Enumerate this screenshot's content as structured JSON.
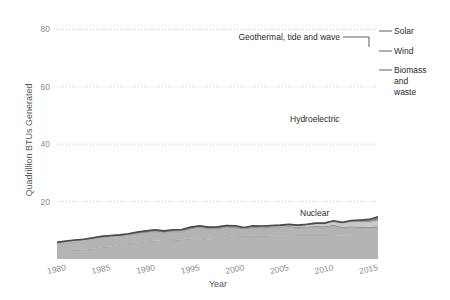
{
  "chart_data": {
    "type": "area",
    "title": "",
    "subtitle": "",
    "xlabel": "Year",
    "ylabel": "Quadrillion BTUs Generated",
    "xlim": [
      1980,
      2016
    ],
    "ylim": [
      0,
      84
    ],
    "xticks": [
      1980,
      1985,
      1990,
      1995,
      2000,
      2005,
      2010,
      2015
    ],
    "xtick_labels": [
      "1980",
      "1985",
      "1990",
      "1995",
      "2000",
      "2005",
      "2010",
      "2015"
    ],
    "yticks": [
      20,
      40,
      60,
      80
    ],
    "ytick_labels": [
      "20",
      "40",
      "60",
      "80"
    ],
    "grid": "horizontal dotted",
    "legend_position": "inline annotations (in-plot labels and right-edge labels)",
    "stacked": true,
    "x": [
      1980,
      1981,
      1982,
      1983,
      1984,
      1985,
      1986,
      1987,
      1988,
      1989,
      1990,
      1991,
      1992,
      1993,
      1994,
      1995,
      1996,
      1997,
      1998,
      1999,
      2000,
      2001,
      2002,
      2003,
      2004,
      2005,
      2006,
      2007,
      2008,
      2009,
      2010,
      2011,
      2012,
      2013,
      2014,
      2015,
      2016
    ],
    "series": [
      {
        "name": "Nuclear",
        "label_in_plot": "Nuclear",
        "color": "#b4b4b4",
        "values": [
          2.7,
          3.0,
          3.1,
          3.2,
          3.6,
          4.1,
          4.4,
          4.9,
          5.6,
          5.7,
          6.1,
          6.4,
          6.5,
          6.5,
          6.8,
          7.1,
          7.2,
          6.7,
          7.1,
          7.6,
          7.9,
          8.0,
          8.1,
          7.9,
          8.2,
          8.2,
          8.2,
          8.4,
          8.4,
          8.4,
          8.4,
          8.3,
          8.1,
          8.3,
          8.3,
          8.3,
          8.4
        ]
      },
      {
        "name": "Hydroelectric",
        "label_in_plot": "Hydroelectric",
        "color": "#b4b4b4",
        "values": [
          2.9,
          3.1,
          3.3,
          3.5,
          3.4,
          3.4,
          3.4,
          3.0,
          2.7,
          3.0,
          3.0,
          3.1,
          2.6,
          2.9,
          2.7,
          3.2,
          3.6,
          3.6,
          3.3,
          3.3,
          2.8,
          2.2,
          2.7,
          2.8,
          2.7,
          2.7,
          2.9,
          2.4,
          2.5,
          2.7,
          2.5,
          3.1,
          2.6,
          2.6,
          2.5,
          2.4,
          2.5
        ]
      },
      {
        "name": "Biomass and waste",
        "label_at_right": "Biomass and waste",
        "color": "#9e9e9e",
        "values": [
          0.1,
          0.1,
          0.1,
          0.1,
          0.2,
          0.2,
          0.2,
          0.3,
          0.3,
          0.4,
          0.4,
          0.4,
          0.4,
          0.5,
          0.5,
          0.5,
          0.5,
          0.5,
          0.5,
          0.5,
          0.5,
          0.4,
          0.4,
          0.4,
          0.4,
          0.4,
          0.4,
          0.4,
          0.4,
          0.4,
          0.5,
          0.5,
          0.5,
          0.5,
          0.5,
          0.5,
          0.5
        ]
      },
      {
        "name": "Wind",
        "label_at_right": "Wind",
        "color": "#c9c9c9",
        "values": [
          0.0,
          0.0,
          0.0,
          0.0,
          0.0,
          0.0,
          0.0,
          0.0,
          0.0,
          0.0,
          0.0,
          0.0,
          0.0,
          0.0,
          0.0,
          0.0,
          0.0,
          0.0,
          0.0,
          0.0,
          0.1,
          0.1,
          0.1,
          0.1,
          0.1,
          0.2,
          0.3,
          0.3,
          0.5,
          0.7,
          0.9,
          1.2,
          1.3,
          1.6,
          1.7,
          1.8,
          2.1
        ]
      },
      {
        "name": "Geothermal, tide and wave",
        "label_callout": "Geothermal, tide and wave",
        "color": "#6e6e6e",
        "values": [
          0.1,
          0.1,
          0.1,
          0.1,
          0.2,
          0.2,
          0.2,
          0.2,
          0.2,
          0.3,
          0.3,
          0.3,
          0.3,
          0.3,
          0.3,
          0.3,
          0.3,
          0.3,
          0.3,
          0.3,
          0.3,
          0.3,
          0.3,
          0.3,
          0.3,
          0.3,
          0.3,
          0.3,
          0.3,
          0.3,
          0.2,
          0.2,
          0.2,
          0.2,
          0.2,
          0.2,
          0.2
        ]
      },
      {
        "name": "Solar",
        "label_at_right": "Solar",
        "color": "#8a8a8a",
        "values": [
          0.0,
          0.0,
          0.0,
          0.0,
          0.0,
          0.0,
          0.0,
          0.0,
          0.0,
          0.0,
          0.0,
          0.0,
          0.0,
          0.0,
          0.0,
          0.0,
          0.0,
          0.0,
          0.0,
          0.0,
          0.0,
          0.0,
          0.0,
          0.0,
          0.0,
          0.0,
          0.0,
          0.0,
          0.0,
          0.0,
          0.0,
          0.0,
          0.1,
          0.2,
          0.4,
          0.6,
          1.0
        ]
      }
    ],
    "totals": [
      5.8,
      6.3,
      6.6,
      6.9,
      7.4,
      7.9,
      8.2,
      8.4,
      8.8,
      9.4,
      9.8,
      10.2,
      9.8,
      10.2,
      10.3,
      11.1,
      11.6,
      11.1,
      11.2,
      11.7,
      11.6,
      11.0,
      11.6,
      11.5,
      11.7,
      11.8,
      12.1,
      11.8,
      12.1,
      12.5,
      12.5,
      13.3,
      12.8,
      13.4,
      13.6,
      13.8,
      14.7
    ]
  },
  "axes": {
    "y_axis_title": "Quadrillion BTUs Generated",
    "x_axis_title": "Year",
    "y_ticks": [
      "20",
      "40",
      "60",
      "80"
    ],
    "x_ticks": [
      "1980",
      "1985",
      "1990",
      "1995",
      "2000",
      "2005",
      "2010",
      "2015"
    ]
  },
  "annotations": {
    "in_plot": [
      {
        "text": "Hydroelectric",
        "name": "hydroelectric-label"
      },
      {
        "text": "Nuclear",
        "name": "nuclear-label"
      }
    ],
    "callout": {
      "text": "Geothermal, tide and wave",
      "name": "geothermal-callout-label"
    },
    "right_labels": [
      {
        "text": "Solar",
        "name": "solar-label"
      },
      {
        "text": "Wind",
        "name": "wind-label"
      },
      {
        "text": "Biomass",
        "name": "biomass-label-line1"
      },
      {
        "text": "and",
        "name": "biomass-label-line2"
      },
      {
        "text": "waste",
        "name": "biomass-label-line3"
      }
    ]
  },
  "colors": {
    "background": "#ffffff",
    "fill_main": "#b4b4b4",
    "fill_mid": "#a0a0a0",
    "fill_light": "#c9c9c9",
    "outline_dark": "#4a4a4a",
    "gridline": "#bdbdbd",
    "tick_text": "#8c8c8c",
    "axis_title": "#5a5a5a",
    "label_text": "#2b2b2b"
  }
}
